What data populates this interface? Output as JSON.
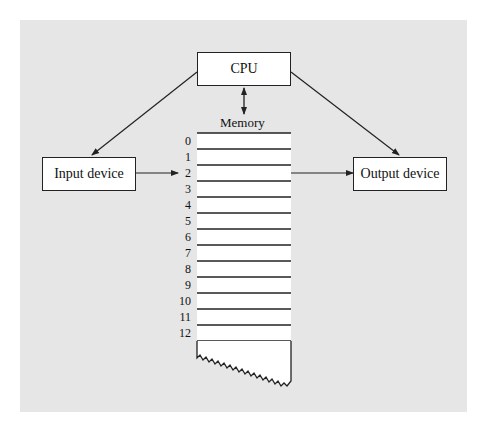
{
  "diagram": {
    "cpu_label": "CPU",
    "memory_label": "Memory",
    "input_label": "Input device",
    "output_label": "Output device",
    "memory_addresses": [
      "0",
      "1",
      "2",
      "3",
      "4",
      "5",
      "6",
      "7",
      "8",
      "9",
      "10",
      "11",
      "12"
    ],
    "colors": {
      "panel": "#e6e6e6",
      "box": "#ffffff",
      "stroke": "#222222"
    }
  }
}
